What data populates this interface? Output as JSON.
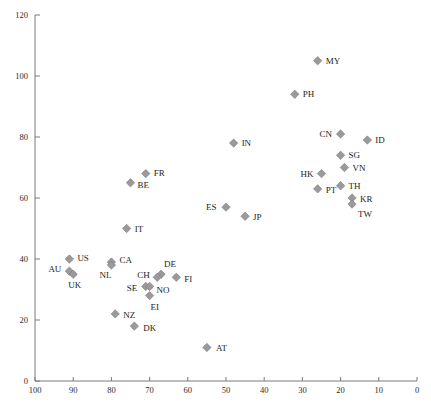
{
  "chart_data": {
    "type": "scatter",
    "title": "",
    "subtitle": "",
    "xlabel": "",
    "ylabel": "",
    "xlim": [
      100,
      0
    ],
    "ylim": [
      0,
      120
    ],
    "x_reversed": true,
    "grid": false,
    "legend": "none",
    "xticks": [
      100,
      90,
      80,
      70,
      60,
      50,
      40,
      30,
      20,
      10,
      0
    ],
    "yticks": [
      0,
      20,
      40,
      60,
      80,
      100,
      120
    ],
    "marker_shape": "diamond",
    "marker_color": "#9a9a9a",
    "marker_edge_color": "#7d7d7d",
    "points": [
      {
        "label": "MY",
        "x": 26,
        "y": 105,
        "lx": 8,
        "ly": 3
      },
      {
        "label": "PH",
        "x": 32,
        "y": 94,
        "lx": 8,
        "ly": 3
      },
      {
        "label": "CN",
        "x": 20,
        "y": 81,
        "lx": -21,
        "ly": 3
      },
      {
        "label": "ID",
        "x": 13,
        "y": 79,
        "lx": 8,
        "ly": 3
      },
      {
        "label": "SG",
        "x": 20,
        "y": 74,
        "lx": 8,
        "ly": 3
      },
      {
        "label": "VN",
        "x": 19,
        "y": 70,
        "lx": 8,
        "ly": 3
      },
      {
        "label": "HK",
        "x": 25,
        "y": 68,
        "lx": -21,
        "ly": 3
      },
      {
        "label": "PT",
        "x": 26,
        "y": 63,
        "lx": 8,
        "ly": 4
      },
      {
        "label": "TH",
        "x": 20,
        "y": 64,
        "lx": 8,
        "ly": 3
      },
      {
        "label": "KR",
        "x": 17,
        "y": 60,
        "lx": 8,
        "ly": 4
      },
      {
        "label": "TW",
        "x": 17,
        "y": 58,
        "lx": 6,
        "ly": 13
      },
      {
        "label": "IN",
        "x": 48,
        "y": 78,
        "lx": 8,
        "ly": 3
      },
      {
        "label": "FR",
        "x": 71,
        "y": 68,
        "lx": 8,
        "ly": 2
      },
      {
        "label": "BE",
        "x": 75,
        "y": 65,
        "lx": 7,
        "ly": 5
      },
      {
        "label": "ES",
        "x": 50,
        "y": 57,
        "lx": -20,
        "ly": 3
      },
      {
        "label": "JP",
        "x": 45,
        "y": 54,
        "lx": 8,
        "ly": 4
      },
      {
        "label": "IT",
        "x": 76,
        "y": 50,
        "lx": 8,
        "ly": 3
      },
      {
        "label": "US",
        "x": 91,
        "y": 40,
        "lx": 8,
        "ly": 2
      },
      {
        "label": "AU",
        "x": 91,
        "y": 36,
        "lx": -21,
        "ly": 1
      },
      {
        "label": "UK",
        "x": 90,
        "y": 35,
        "lx": -5,
        "ly": 14
      },
      {
        "label": "CA",
        "x": 80,
        "y": 39,
        "lx": 8,
        "ly": 1
      },
      {
        "label": "NL",
        "x": 80,
        "y": 38,
        "lx": -12,
        "ly": 13
      },
      {
        "label": "DE",
        "x": 67,
        "y": 35,
        "lx": 3,
        "ly": -7
      },
      {
        "label": "CH",
        "x": 68,
        "y": 34,
        "lx": -20,
        "ly": 1
      },
      {
        "label": "SE",
        "x": 71,
        "y": 31,
        "lx": -19,
        "ly": 5
      },
      {
        "label": "NO",
        "x": 70,
        "y": 31,
        "lx": 7,
        "ly": 7
      },
      {
        "label": "EI",
        "x": 70,
        "y": 28,
        "lx": 1,
        "ly": 14
      },
      {
        "label": "FI",
        "x": 63,
        "y": 34,
        "lx": 8,
        "ly": 5
      },
      {
        "label": "NZ",
        "x": 79,
        "y": 22,
        "lx": 8,
        "ly": 4
      },
      {
        "label": "DK",
        "x": 74,
        "y": 18,
        "lx": 9,
        "ly": 5
      },
      {
        "label": "AT",
        "x": 55,
        "y": 11,
        "lx": 9,
        "ly": 4
      }
    ]
  },
  "axes": {
    "x_axis_name": "x-axis",
    "y_axis_name": "y-axis"
  }
}
